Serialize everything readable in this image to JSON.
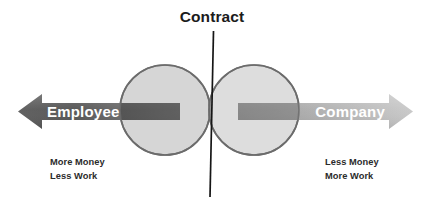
{
  "diagram": {
    "title": "Contract",
    "background_color": "#ffffff",
    "divider": {
      "name": "contract-divider-line",
      "color": "#161616"
    },
    "left": {
      "arrow_label": "Employee",
      "arrow_direction": "left",
      "arrow_color_dark": "#545454",
      "arrow_color_light": "#8a8a8a",
      "label_color": "#ffffff",
      "caption_line1": "More Money",
      "caption_line2": "Less Work",
      "circle_fill": "#d4d4d4",
      "circle_stroke": "#6d6d6d"
    },
    "right": {
      "arrow_label": "Company",
      "arrow_direction": "right",
      "arrow_color_dark": "#8d8d8d",
      "arrow_color_light": "#c3c3c3",
      "label_color": "#ffffff",
      "caption_line1": "Less Money",
      "caption_line2": "More Work",
      "circle_fill": "#d9d9d9",
      "circle_stroke": "#6d6d6d"
    }
  }
}
